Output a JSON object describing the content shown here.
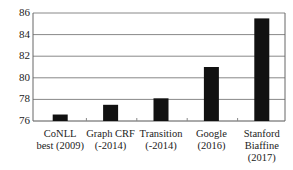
{
  "chart_data": {
    "type": "bar",
    "title": "",
    "xlabel": "",
    "ylabel": "",
    "categories": [
      "CoNLL best (2009)",
      "Graph CRF (-2014)",
      "Transition (-2014)",
      "Google (2016)",
      "Stanford Biaffine (2017)"
    ],
    "category_lines": [
      [
        "CoNLL",
        "best (2009)"
      ],
      [
        "Graph CRF",
        "(-2014)"
      ],
      [
        "Transition",
        "(-2014)"
      ],
      [
        "Google",
        "(2016)"
      ],
      [
        "Stanford",
        "Biaffine",
        "(2017)"
      ]
    ],
    "values": [
      76.6,
      77.5,
      78.1,
      81.0,
      85.5
    ],
    "ylim": [
      76,
      86
    ],
    "yticks": [
      76,
      78,
      80,
      82,
      84,
      86
    ],
    "grid": true,
    "legend": null,
    "bar_color": "#111111",
    "grid_color": "#888888"
  }
}
